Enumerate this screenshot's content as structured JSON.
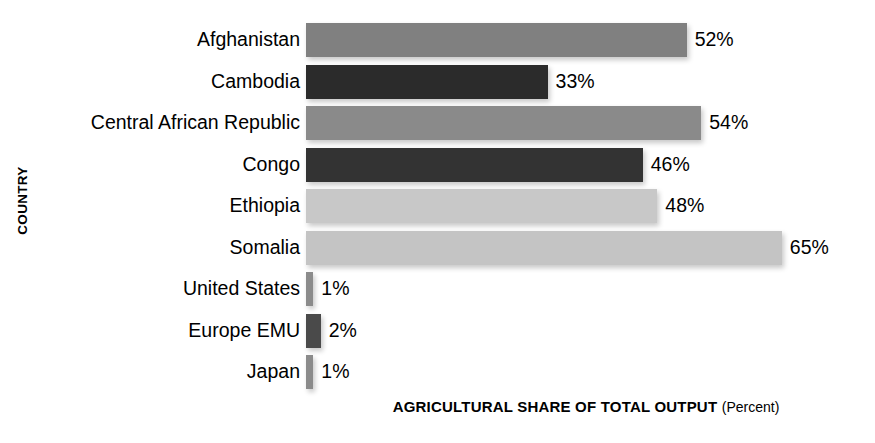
{
  "chart_data": {
    "type": "bar",
    "orientation": "horizontal",
    "title": "",
    "xlabel": "AGRICULTURAL SHARE OF TOTAL OUTPUT",
    "xlabel_unit": "(Percent)",
    "ylabel": "COUNTRY",
    "xlim": [
      0,
      65
    ],
    "grid": false,
    "legend": "none",
    "value_suffix": "%",
    "categories": [
      "Afghanistan",
      "Cambodia",
      "Central African Republic",
      "Congo",
      "Ethiopia",
      "Somalia",
      "United States",
      "Europe EMU",
      "Japan"
    ],
    "values": [
      52,
      33,
      54,
      46,
      48,
      65,
      1,
      2,
      1
    ],
    "value_labels": [
      "52%",
      "33%",
      "54%",
      "46%",
      "48%",
      "65%",
      "1%",
      "2%",
      "1%"
    ],
    "bar_colors": [
      "#808080",
      "#2b2b2b",
      "#8a8a8a",
      "#333333",
      "#c8c8c8",
      "#c4c4c4",
      "#8b8b8b",
      "#4a4a4a",
      "#8b8b8b"
    ],
    "bars": [
      {
        "label": "Afghanistan",
        "value": 52,
        "value_label": "52%",
        "color": "#808080"
      },
      {
        "label": "Cambodia",
        "value": 33,
        "value_label": "33%",
        "color": "#2b2b2b"
      },
      {
        "label": "Central African Republic",
        "value": 54,
        "value_label": "54%",
        "color": "#8a8a8a"
      },
      {
        "label": "Congo",
        "value": 46,
        "value_label": "46%",
        "color": "#333333"
      },
      {
        "label": "Ethiopia",
        "value": 48,
        "value_label": "48%",
        "color": "#c8c8c8"
      },
      {
        "label": "Somalia",
        "value": 65,
        "value_label": "65%",
        "color": "#c4c4c4"
      },
      {
        "label": "United States",
        "value": 1,
        "value_label": "1%",
        "color": "#8b8b8b"
      },
      {
        "label": "Europe EMU",
        "value": 2,
        "value_label": "2%",
        "color": "#4a4a4a"
      },
      {
        "label": "Japan",
        "value": 1,
        "value_label": "1%",
        "color": "#8b8b8b"
      }
    ]
  },
  "axes": {
    "y_title": "COUNTRY",
    "x_title_main": "AGRICULTURAL SHARE OF TOTAL OUTPUT",
    "x_title_sub": "(Percent)"
  },
  "layout": {
    "plot_left_px": 306,
    "px_per_percent": 7.32,
    "row_height_px": 41.5,
    "bar_height_px": 34,
    "first_row_top_px": 23,
    "min_bar_px": 6
  }
}
